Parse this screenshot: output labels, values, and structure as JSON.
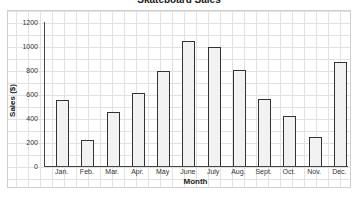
{
  "chart_data": {
    "type": "bar",
    "title": "Skateboard Sales",
    "xlabel": "Month",
    "ylabel": "Sales ($)",
    "ylim": [
      0,
      1200
    ],
    "yticks": [
      0,
      200,
      400,
      600,
      800,
      1000,
      1200
    ],
    "grid": true,
    "categories": [
      "Jan.",
      "Feb.",
      "Mar.",
      "Apr.",
      "May",
      "June",
      "July",
      "Aug.",
      "Sept.",
      "Oct.",
      "Nov.",
      "Dec."
    ],
    "values": [
      550,
      220,
      450,
      610,
      790,
      1040,
      990,
      800,
      560,
      420,
      240,
      870
    ]
  }
}
